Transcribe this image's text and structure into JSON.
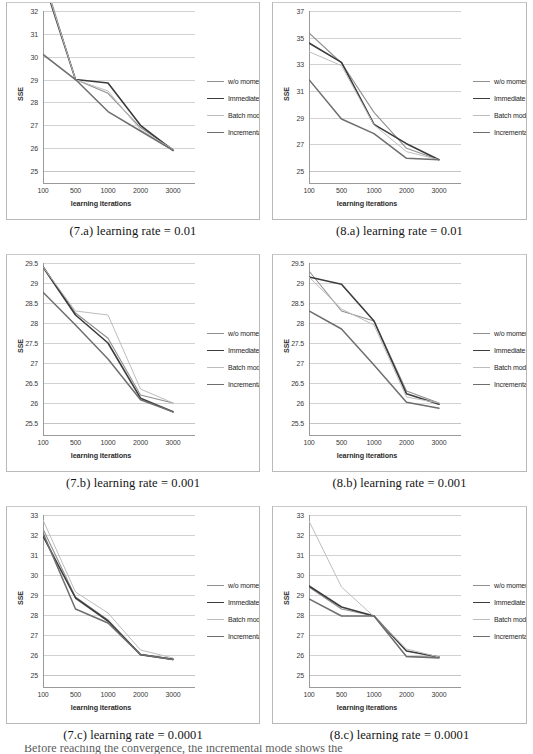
{
  "document": {
    "bottom_partial_line": "Before reaching the convergence, the incremental mode shows the"
  },
  "legend_series": [
    {
      "label": "w/o momentum",
      "color": "#8f8f8f",
      "width": 1.1
    },
    {
      "label": "Immediate mode",
      "color": "#3c3c3c",
      "width": 1.6
    },
    {
      "label": "Batch mode",
      "color": "#bdbdbd",
      "width": 1.0
    },
    {
      "label": "Incremental mode",
      "color": "#6e6e6e",
      "width": 1.5
    }
  ],
  "axis": {
    "xlabel": "learning iterations",
    "ylabel": "SSE",
    "categories": [
      "100",
      "500",
      "1000",
      "2000",
      "3000"
    ]
  },
  "charts": [
    {
      "id": "chart-7a",
      "caption": "(7.a) learning rate = 0.01",
      "chart_data": {
        "type": "line",
        "title": "(7.a) learning rate = 0.01",
        "xlabel": "learning iterations",
        "ylabel": "SSE",
        "categories": [
          "100",
          "500",
          "1000",
          "2000",
          "3000"
        ],
        "yticks": [
          25,
          26,
          27,
          28,
          29,
          30,
          31,
          32
        ],
        "ylim": [
          25,
          32
        ],
        "grid": true,
        "legend_position": "right",
        "series": [
          {
            "name": "w/o momentum",
            "values": [
              33.6,
              29.0,
              28.4,
              26.9,
              25.95
            ]
          },
          {
            "name": "Immediate mode",
            "values": [
              33.4,
              29.0,
              28.85,
              27.0,
              25.9
            ]
          },
          {
            "name": "Batch mode",
            "values": [
              33.5,
              29.0,
              28.5,
              26.8,
              25.95
            ]
          },
          {
            "name": "Incremental mode",
            "values": [
              30.1,
              29.0,
              27.6,
              26.75,
              25.9
            ]
          }
        ]
      }
    },
    {
      "id": "chart-8a",
      "caption": "(8.a) learning rate = 0.01",
      "chart_data": {
        "type": "line",
        "title": "(8.a) learning rate = 0.01",
        "xlabel": "learning iterations",
        "ylabel": "SSE",
        "categories": [
          "100",
          "500",
          "1000",
          "2000",
          "3000"
        ],
        "yticks": [
          25,
          27,
          29,
          31,
          33,
          35,
          37
        ],
        "ylim": [
          25,
          37
        ],
        "grid": true,
        "legend_position": "right",
        "series": [
          {
            "name": "w/o momentum",
            "values": [
              35.35,
              33.1,
              29.4,
              26.7,
              25.85
            ]
          },
          {
            "name": "Immediate mode",
            "values": [
              34.6,
              33.15,
              28.5,
              27.05,
              25.85
            ]
          },
          {
            "name": "Batch mode",
            "values": [
              33.95,
              32.9,
              28.45,
              26.45,
              25.85
            ]
          },
          {
            "name": "Incremental mode",
            "values": [
              31.85,
              28.9,
              27.8,
              25.95,
              25.85
            ]
          }
        ]
      }
    },
    {
      "id": "chart-7b",
      "caption": "(7.b) learning rate = 0.001",
      "chart_data": {
        "type": "line",
        "title": "(7.b) learning rate = 0.001",
        "xlabel": "learning iterations",
        "ylabel": "SSE",
        "categories": [
          "100",
          "500",
          "1000",
          "2000",
          "3000"
        ],
        "yticks": [
          25.5,
          26,
          26.5,
          27,
          27.5,
          28,
          28.5,
          29,
          29.5
        ],
        "ylim": [
          25.5,
          29.5
        ],
        "grid": true,
        "legend_position": "right",
        "series": [
          {
            "name": "w/o momentum",
            "values": [
              29.42,
              28.25,
              27.62,
              26.2,
              26.0
            ]
          },
          {
            "name": "Immediate mode",
            "values": [
              29.4,
              28.2,
              27.5,
              26.12,
              25.78
            ]
          },
          {
            "name": "Batch mode",
            "values": [
              29.4,
              28.3,
              28.2,
              26.35,
              26.0
            ]
          },
          {
            "name": "Incremental mode",
            "values": [
              28.77,
              27.95,
              27.1,
              26.08,
              25.78
            ]
          }
        ]
      }
    },
    {
      "id": "chart-8b",
      "caption": "(8.b) learning rate = 0.001",
      "chart_data": {
        "type": "line",
        "title": "(8.b) learning rate = 0.001",
        "xlabel": "learning iterations",
        "ylabel": "SSE",
        "categories": [
          "100",
          "500",
          "1000",
          "2000",
          "3000"
        ],
        "yticks": [
          25.5,
          26,
          26.5,
          27,
          27.5,
          28,
          28.5,
          29,
          29.5
        ],
        "ylim": [
          25.5,
          29.5
        ],
        "grid": true,
        "legend_position": "right",
        "series": [
          {
            "name": "w/o momentum",
            "values": [
              29.3,
              28.3,
              28.05,
              26.3,
              26.0
            ]
          },
          {
            "name": "Immediate mode",
            "values": [
              29.15,
              28.97,
              28.05,
              26.23,
              25.97
            ]
          },
          {
            "name": "Batch mode",
            "values": [
              29.15,
              28.35,
              27.95,
              26.15,
              26.0
            ]
          },
          {
            "name": "Incremental mode",
            "values": [
              28.3,
              27.85,
              26.95,
              26.02,
              25.87
            ]
          }
        ]
      }
    },
    {
      "id": "chart-7c",
      "caption": "(7.c) learning rate = 0.0001",
      "chart_data": {
        "type": "line",
        "title": "(7.c) learning rate = 0.0001",
        "xlabel": "learning iterations",
        "ylabel": "SSE",
        "categories": [
          "100",
          "500",
          "1000",
          "2000",
          "3000"
        ],
        "yticks": [
          25,
          26,
          27,
          28,
          29,
          30,
          31,
          32,
          33
        ],
        "ylim": [
          25,
          33
        ],
        "grid": true,
        "legend_position": "right",
        "series": [
          {
            "name": "w/o momentum",
            "values": [
              32.3,
              28.9,
              27.75,
              26.02,
              25.8
            ]
          },
          {
            "name": "Immediate mode",
            "values": [
              31.95,
              28.85,
              27.7,
              26.02,
              25.78
            ]
          },
          {
            "name": "Batch mode",
            "values": [
              32.75,
              29.15,
              28.1,
              26.25,
              25.85
            ]
          },
          {
            "name": "Incremental mode",
            "values": [
              32.1,
              28.3,
              27.6,
              26.02,
              25.78
            ]
          }
        ]
      }
    },
    {
      "id": "chart-8c",
      "caption": "(8.c) learning rate = 0.0001",
      "chart_data": {
        "type": "line",
        "title": "(8.c) learning rate = 0.0001",
        "xlabel": "learning iterations",
        "ylabel": "SSE",
        "categories": [
          "100",
          "500",
          "1000",
          "2000",
          "3000"
        ],
        "yticks": [
          25,
          26,
          27,
          28,
          29,
          30,
          31,
          32,
          33
        ],
        "ylim": [
          25,
          33
        ],
        "grid": true,
        "legend_position": "right",
        "series": [
          {
            "name": "w/o momentum",
            "values": [
              29.4,
              28.3,
              27.95,
              25.92,
              25.9
            ]
          },
          {
            "name": "Immediate mode",
            "values": [
              29.45,
              28.4,
              27.95,
              26.2,
              25.9
            ]
          },
          {
            "name": "Batch mode",
            "values": [
              32.7,
              29.4,
              27.92,
              26.3,
              25.9
            ]
          },
          {
            "name": "Incremental mode",
            "values": [
              28.8,
              27.95,
              27.95,
              25.92,
              25.85
            ]
          }
        ]
      }
    }
  ]
}
